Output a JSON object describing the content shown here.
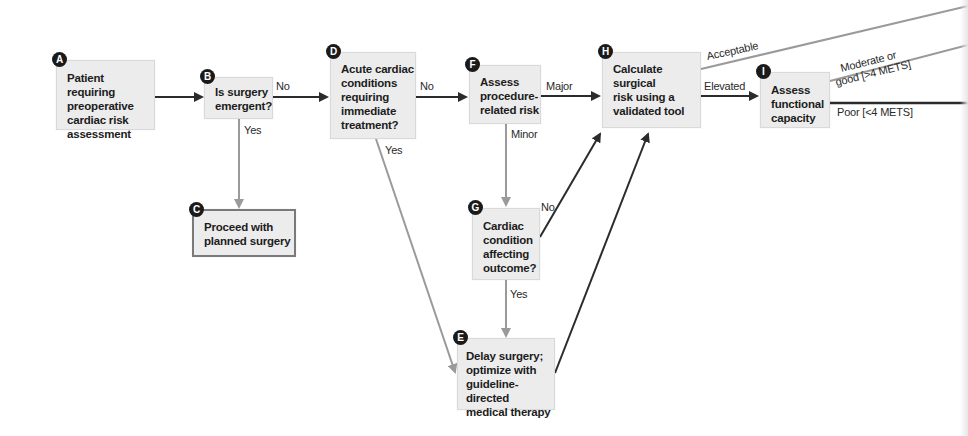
{
  "diagram": {
    "colors": {
      "box_fill": "#ececec",
      "arrow_dark": "#2b2b2b",
      "arrow_gray": "#9a9a9a",
      "badge": "#1a1a1a"
    },
    "nodes": [
      {
        "id": "A",
        "badge": "A",
        "text": "Patient requiring\npreoperative\ncardiac risk\nassessment"
      },
      {
        "id": "B",
        "badge": "B",
        "text": "Is surgery\nemergent?"
      },
      {
        "id": "C",
        "badge": "C",
        "text": "Proceed with\nplanned surgery"
      },
      {
        "id": "D",
        "badge": "D",
        "text": "Acute cardiac\nconditions\nrequiring\nimmediate\ntreatment?"
      },
      {
        "id": "E",
        "badge": "E",
        "text": "Delay surgery;\noptimize with\nguideline-directed\nmedical therapy"
      },
      {
        "id": "F",
        "badge": "F",
        "text": "Assess\nprocedure-\nrelated risk"
      },
      {
        "id": "G",
        "badge": "G",
        "text": "Cardiac\ncondition\naffecting\noutcome?"
      },
      {
        "id": "H",
        "badge": "H",
        "text": "Calculate\nsurgical\nrisk using a\nvalidated tool"
      },
      {
        "id": "I",
        "badge": "I",
        "text": "Assess\nfunctional\ncapacity"
      }
    ],
    "edges": [
      {
        "from": "A",
        "to": "B",
        "label": ""
      },
      {
        "from": "B",
        "to": "D",
        "label": "No"
      },
      {
        "from": "B",
        "to": "C",
        "label": "Yes"
      },
      {
        "from": "D",
        "to": "F",
        "label": "No"
      },
      {
        "from": "D",
        "to": "E",
        "label": "Yes"
      },
      {
        "from": "F",
        "to": "H",
        "label": "Major"
      },
      {
        "from": "F",
        "to": "G",
        "label": "Minor"
      },
      {
        "from": "G",
        "to": "H",
        "label": "No"
      },
      {
        "from": "G",
        "to": "E",
        "label": "Yes"
      },
      {
        "from": "E",
        "to": "H",
        "label": ""
      },
      {
        "from": "H",
        "to": "offscreen",
        "label": "Acceptable"
      },
      {
        "from": "H",
        "to": "I",
        "label": "Elevated"
      },
      {
        "from": "I",
        "to": "offscreen",
        "label": "Moderate or\ngood [>4 METS]"
      },
      {
        "from": "I",
        "to": "offscreen",
        "label": "Poor [<4 METS]"
      }
    ],
    "labels": {
      "b_no": "No",
      "b_yes": "Yes",
      "d_no": "No",
      "d_yes": "Yes",
      "f_major": "Major",
      "f_minor": "Minor",
      "g_no": "No",
      "g_yes": "Yes",
      "h_acceptable": "Acceptable",
      "h_elevated": "Elevated",
      "i_moderate_line1": "Moderate or",
      "i_moderate_line2": "good [>4 METS]",
      "i_poor": "Poor [<4 METS]"
    }
  }
}
